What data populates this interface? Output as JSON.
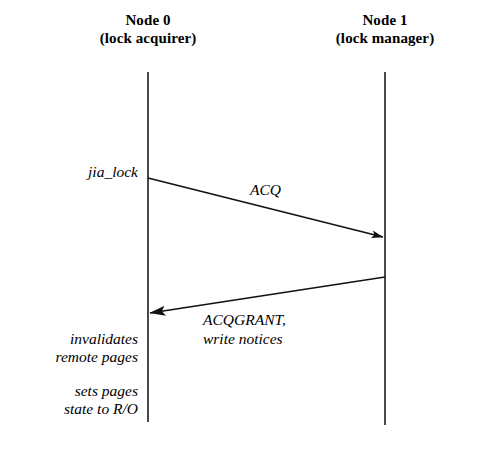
{
  "figure": {
    "kind": "sequence-diagram",
    "background_color": "#ffffff",
    "ink_color": "#000000",
    "width": 487,
    "height": 450
  },
  "participants": [
    {
      "id": "node0",
      "title": "Node 0",
      "role": "(lock acquirer)",
      "lifeline_x": 148,
      "lifeline_top": 72,
      "lifeline_bottom": 422
    },
    {
      "id": "node1",
      "title": "Node 1",
      "role": "(lock manager)",
      "lifeline_x": 385,
      "lifeline_top": 72,
      "lifeline_bottom": 425
    }
  ],
  "messages": [
    {
      "id": "acq",
      "label": "ACQ",
      "from": "node0",
      "to": "node1",
      "direction": "right",
      "x1": 148,
      "y1": 178,
      "x2": 385,
      "y2": 238,
      "label_x": 250,
      "label_y": 180
    },
    {
      "id": "acqgrant",
      "label_line1": "ACQGRANT,",
      "label_line2": "write notices",
      "from": "node1",
      "to": "node0",
      "direction": "left",
      "x1": 385,
      "y1": 277,
      "x2": 148,
      "y2": 313,
      "label_x": 203,
      "label_y": 310
    }
  ],
  "annotations": [
    {
      "id": "jia-lock",
      "text": "jia_lock",
      "side": "left",
      "x": 138,
      "y": 163
    },
    {
      "id": "invalidates-remote-pages",
      "line1": "invalidates",
      "line2": "remote pages",
      "side": "left",
      "x": 138,
      "y": 330
    },
    {
      "id": "sets-pages-state",
      "line1": "sets pages",
      "line2": "state to R/O",
      "side": "left",
      "x": 138,
      "y": 382
    }
  ]
}
